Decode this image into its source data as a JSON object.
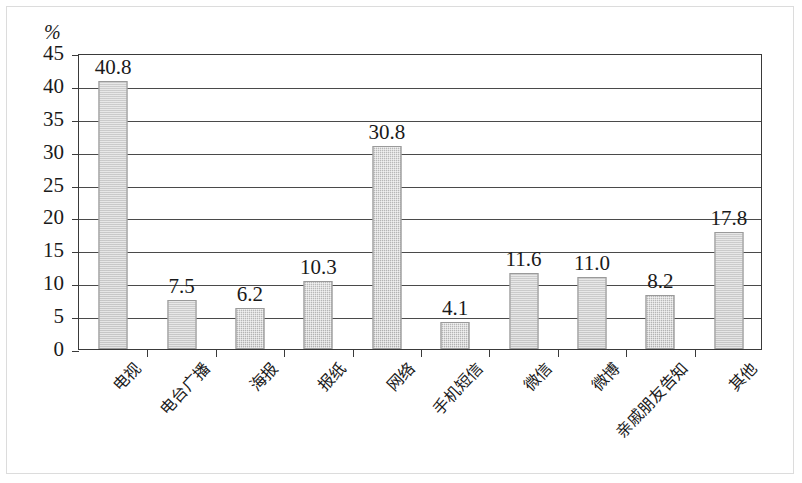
{
  "chart_data": {
    "type": "bar",
    "title": "",
    "xlabel": "",
    "ylabel": "%",
    "unit_label": "%",
    "ylim": [
      0,
      45
    ],
    "ytick_step": 5,
    "yticks": [
      "45",
      "40",
      "35",
      "30",
      "25",
      "20",
      "15",
      "10",
      "5",
      "0"
    ],
    "grid": true,
    "legend": "none",
    "bar_color": "#b4b4b4",
    "bar_edge_color": "#9a9a9a",
    "axis_color": "#3a3a3a",
    "categories": [
      "电视",
      "电台广播",
      "海报",
      "报纸",
      "网络",
      "手机短信",
      "微信",
      "微博",
      "亲戚朋友告知",
      "其他"
    ],
    "values": [
      40.8,
      7.5,
      6.2,
      10.3,
      30.8,
      4.1,
      11.6,
      11.0,
      8.2,
      17.8
    ],
    "value_labels": [
      "40.8",
      "7.5",
      "6.2",
      "10.3",
      "30.8",
      "4.1",
      "11.6",
      "11.0",
      "8.2",
      "17.8"
    ]
  }
}
